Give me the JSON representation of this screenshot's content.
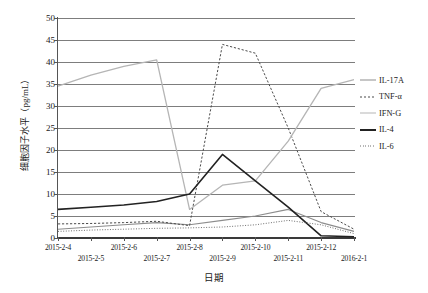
{
  "chart_data": {
    "type": "line",
    "title": "",
    "xlabel": "日期",
    "ylabel": "细胞因子水平（pg/mL）",
    "categories": [
      "2015-2-4",
      "2015-2-5",
      "2015-2-6",
      "2015-2-7",
      "2015-2-8",
      "2015-2-9",
      "2015-2-10",
      "2015-2-11",
      "2015-2-12",
      "2016-2-1"
    ],
    "ylim": [
      0,
      50
    ],
    "ytick_values": [
      0,
      5,
      10,
      15,
      20,
      25,
      30,
      35,
      40,
      45,
      50
    ],
    "ytick_labels": [
      "0",
      "5",
      "10",
      "15",
      "20",
      "25",
      "30",
      "35",
      "40",
      "45",
      "50"
    ],
    "grid": true,
    "legend_position": "right",
    "series": [
      {
        "name": "IL-17A",
        "color": "#8d8d8d",
        "style": "solid",
        "width": 1.1,
        "values": [
          2.0,
          2.5,
          3.0,
          3.5,
          3.0,
          4.0,
          5.0,
          6.5,
          3.5,
          1.5
        ]
      },
      {
        "name": "TNF-α",
        "color": "#4a4a4a",
        "style": "dashed",
        "width": 1.0,
        "values": [
          3.2,
          3.3,
          3.5,
          3.8,
          2.8,
          44.0,
          42.0,
          25.0,
          6.0,
          2.0
        ]
      },
      {
        "name": "IFN-G",
        "color": "#b5b5b5",
        "style": "solid",
        "width": 1.3,
        "values": [
          34.5,
          37.0,
          39.0,
          40.5,
          6.5,
          12.0,
          13.0,
          22.0,
          34.0,
          36.0
        ]
      },
      {
        "name": "IL-4",
        "color": "#222222",
        "style": "solid",
        "width": 1.6,
        "values": [
          6.5,
          7.0,
          7.5,
          8.3,
          10.0,
          19.0,
          13.0,
          7.0,
          0.5,
          0.3
        ]
      },
      {
        "name": "IL-6",
        "color": "#6f6f6f",
        "style": "dotted",
        "width": 1.0,
        "values": [
          1.5,
          1.8,
          2.0,
          2.2,
          2.3,
          2.5,
          3.0,
          4.0,
          3.0,
          1.0
        ]
      }
    ]
  },
  "legend": {
    "items": [
      {
        "label": "IL-17A"
      },
      {
        "label": "TNF-α"
      },
      {
        "label": "IFN-G"
      },
      {
        "label": "IL-4"
      },
      {
        "label": "IL-6"
      }
    ]
  }
}
